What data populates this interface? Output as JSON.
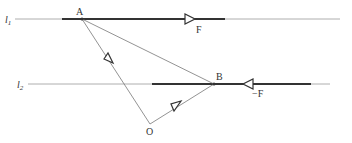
{
  "labels": {
    "line1": "l",
    "line1_sub": "1",
    "line2": "l",
    "line2_sub": "2",
    "pointA": "A",
    "pointB": "B",
    "pointO": "O",
    "force1": "F",
    "force2": "−F"
  },
  "colors": {
    "line": "#444444",
    "thin": "#777777",
    "background": "#ffffff"
  }
}
